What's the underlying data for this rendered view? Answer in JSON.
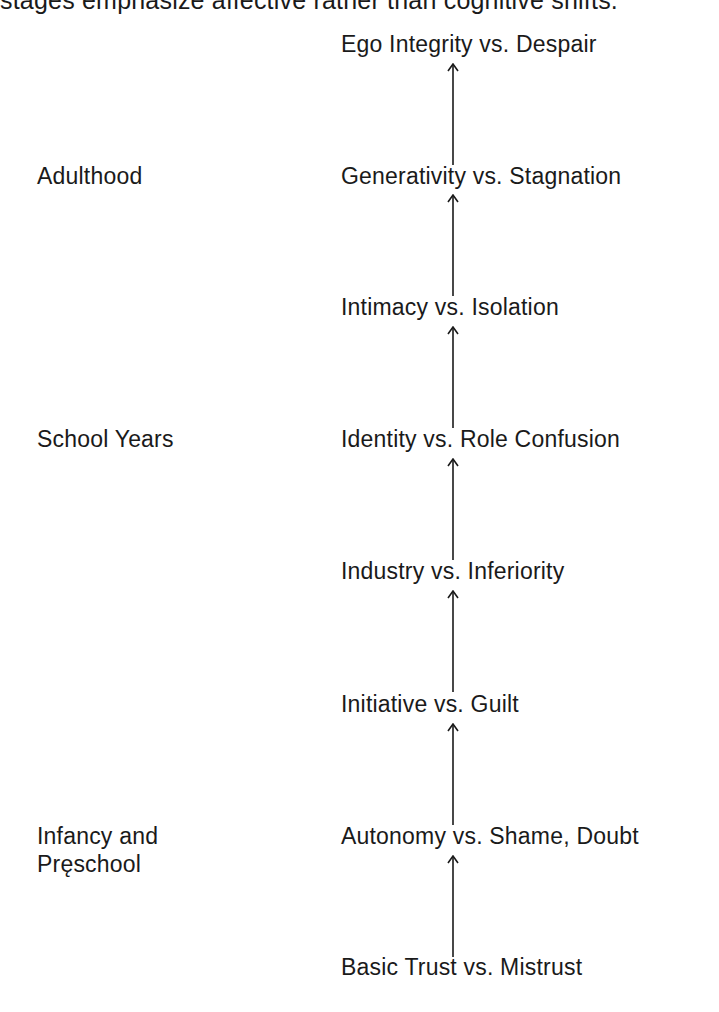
{
  "intro_text": "stages emphasize affective rather than cognitive shifts.",
  "stages": [
    {
      "label": "Ego Integrity vs. Despair"
    },
    {
      "label": "Generativity vs. Stagnation"
    },
    {
      "label": "Intimacy vs. Isolation"
    },
    {
      "label": "Identity vs. Role Confusion"
    },
    {
      "label": "Industry vs. Inferiority"
    },
    {
      "label": "Initiative vs. Guilt"
    },
    {
      "label": "Autonomy vs. Shame, Doubt"
    },
    {
      "label": "Basic Trust vs. Mistrust"
    }
  ],
  "periods": [
    {
      "label": "Adulthood"
    },
    {
      "label": "School Years"
    },
    {
      "label_line1": "Infancy and",
      "label_line2": "Pręschool"
    }
  ],
  "arrow_icon": "arrow-up-icon",
  "colors": {
    "text": "#1a1a1a",
    "background": "#ffffff"
  }
}
